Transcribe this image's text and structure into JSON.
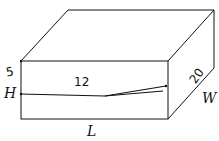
{
  "diagram": {
    "type": "rectangular-prism",
    "labels": {
      "length": "L",
      "width": "W",
      "height": "H"
    },
    "handwritten": {
      "height_value": "5",
      "length_value": "12",
      "width_value": "20"
    },
    "stroke_color": "#111111",
    "background": "#ffffff"
  }
}
